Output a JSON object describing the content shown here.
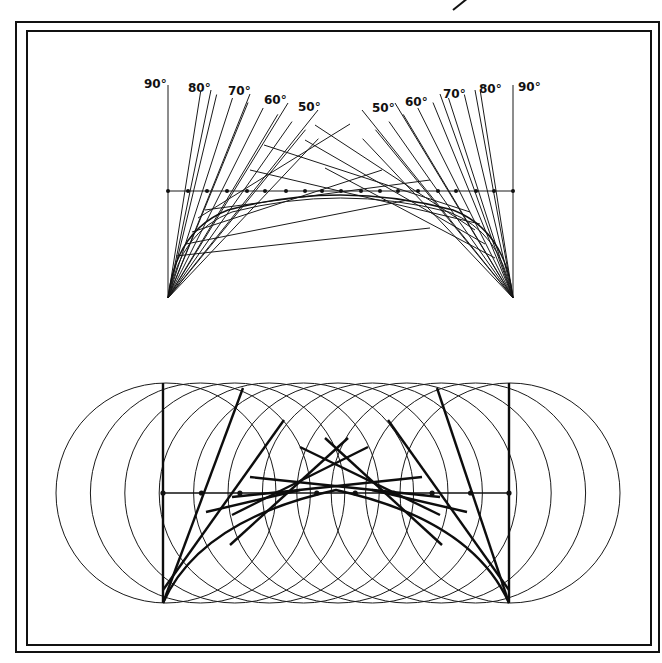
{
  "figure": {
    "title": "",
    "frame": {
      "outer": {
        "x1": 16,
        "y1": 22,
        "x2": 659,
        "y2": 652
      },
      "inner": {
        "x1": 27,
        "y1": 30,
        "x2": 651,
        "y2": 645
      }
    },
    "corner_mark": {
      "x1": 455,
      "y1": 8,
      "x2": 467,
      "y2": -3
    }
  },
  "top_diagram": {
    "name": "envelope-of-trajectories",
    "left_origin": {
      "x": 168,
      "y": 298
    },
    "right_origin": {
      "x": 513,
      "y": 298
    },
    "baseline_y": 191,
    "left_labels": [
      "90°",
      "80°",
      "70°",
      "60°",
      "50°"
    ],
    "right_labels": [
      "50°",
      "60°",
      "70°",
      "80°",
      "90°"
    ],
    "left_angles": [
      90,
      80,
      70,
      60,
      50
    ],
    "right_angles": [
      50,
      60,
      70,
      80,
      90
    ],
    "dot_count": 19
  },
  "bottom_diagram": {
    "name": "circle-construction",
    "left_bar_x": 163,
    "right_bar_x": 509,
    "bar_top_y": 383,
    "bar_bottom_y": 603,
    "axis_y": 493,
    "circle_radius": 110,
    "circle_count": 11,
    "dot_count": 10
  },
  "colors": {
    "ink": "#111111",
    "paper": "#ffffff"
  }
}
